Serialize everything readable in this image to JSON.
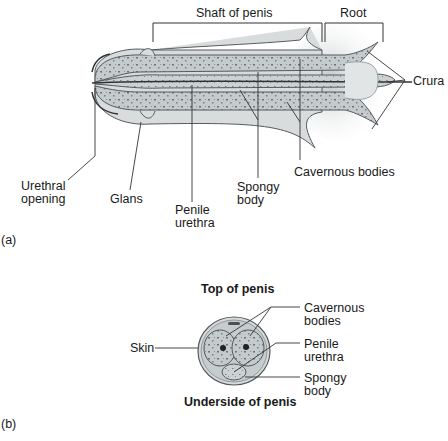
{
  "figure_a": {
    "panel_label": "(a)",
    "brackets": {
      "shaft": "Shaft of penis",
      "root": "Root"
    },
    "labels": {
      "crura": "Crura",
      "urethral_opening_line1": "Urethral",
      "urethral_opening_line2": "opening",
      "glans": "Glans",
      "penile_urethra_line1": "Penile",
      "penile_urethra_line2": "urethra",
      "spongy_body_line1": "Spongy",
      "spongy_body_line2": "body",
      "cavernous_bodies": "Cavernous bodies"
    }
  },
  "figure_b": {
    "panel_label": "(b)",
    "top_caption": "Top of penis",
    "bottom_caption": "Underside of penis",
    "labels": {
      "skin": "Skin",
      "cavernous_line1": "Cavernous",
      "cavernous_line2": "bodies",
      "penile_urethra_line1": "Penile",
      "penile_urethra_line2": "urethra",
      "spongy_line1": "Spongy",
      "spongy_line2": "body"
    }
  },
  "colors": {
    "tissue_fill": "#c9ced0",
    "tissue_light": "#dde1e2",
    "outline": "#555b5e",
    "dots": "#6d7477",
    "leader": "#333333"
  }
}
